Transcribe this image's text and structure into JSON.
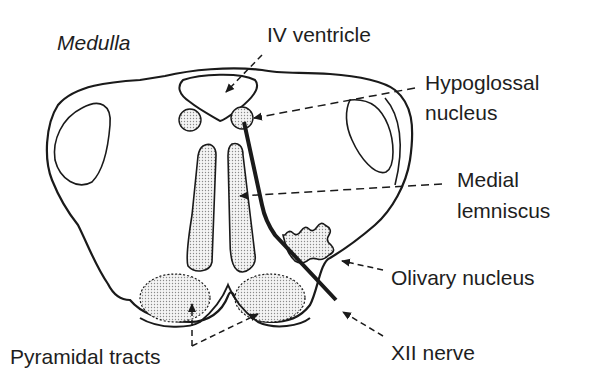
{
  "diagram": {
    "title": "Medulla",
    "labels": {
      "ventricle": "IV ventricle",
      "hypoglossal_line1": "Hypoglossal",
      "hypoglossal_line2": "nucleus",
      "medial_line1": "Medial",
      "medial_line2": "lemniscus",
      "olivary": "Olivary nucleus",
      "pyramidal": "Pyramidal tracts",
      "nerve": "XII nerve"
    },
    "colors": {
      "ink": "#1a1a1a",
      "stipple": "#d6d6d6",
      "background": "#ffffff"
    }
  }
}
